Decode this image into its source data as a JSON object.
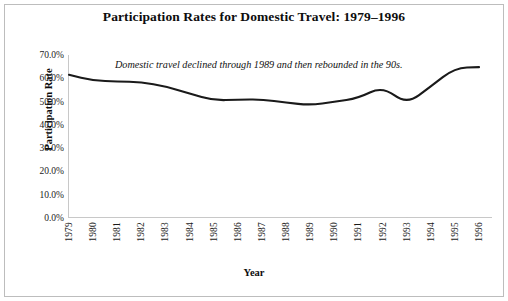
{
  "chart_data": {
    "type": "line",
    "title": "Participation Rates for Domestic Travel: 1979–1996",
    "xlabel": "Year",
    "ylabel": "Participation Rate",
    "annotation": "Domestic travel declined through 1989 and then rebounded in the 90s.",
    "grid": false,
    "legend": "none",
    "ylim": [
      0.0,
      70.0
    ],
    "yticks": [
      0.0,
      10.0,
      20.0,
      30.0,
      40.0,
      50.0,
      60.0,
      70.0
    ],
    "ytick_labels": [
      "0.0%",
      "10.0%",
      "20.0%",
      "30.0%",
      "40.0%",
      "50.0%",
      "60.0%",
      "70.0%"
    ],
    "categories": [
      "1979",
      "1980",
      "1981",
      "1982",
      "1983",
      "1984",
      "1985",
      "1986",
      "1987",
      "1988",
      "1989",
      "1990",
      "1991",
      "1992",
      "1993",
      "1994",
      "1995",
      "1996"
    ],
    "values": [
      61.5,
      59.0,
      58.7,
      58.3,
      56.5,
      53.5,
      50.5,
      50.8,
      51.0,
      49.5,
      48.5,
      49.8,
      51.5,
      56.5,
      48.8,
      56.5,
      64.5,
      64.8
    ],
    "series": [
      {
        "name": "Participation Rate",
        "color": "#1a1a1a",
        "values": [
          61.5,
          59.0,
          58.7,
          58.3,
          56.5,
          53.5,
          50.5,
          50.8,
          51.0,
          49.5,
          48.5,
          49.8,
          51.5,
          56.5,
          48.8,
          56.5,
          64.5,
          64.8
        ]
      }
    ]
  },
  "style": {
    "line_color": "#1a1a1a",
    "axis_color": "#c8c8c8",
    "frame_color": "#bdbdbd",
    "text_color": "#1a1a1a",
    "background": "#ffffff"
  }
}
